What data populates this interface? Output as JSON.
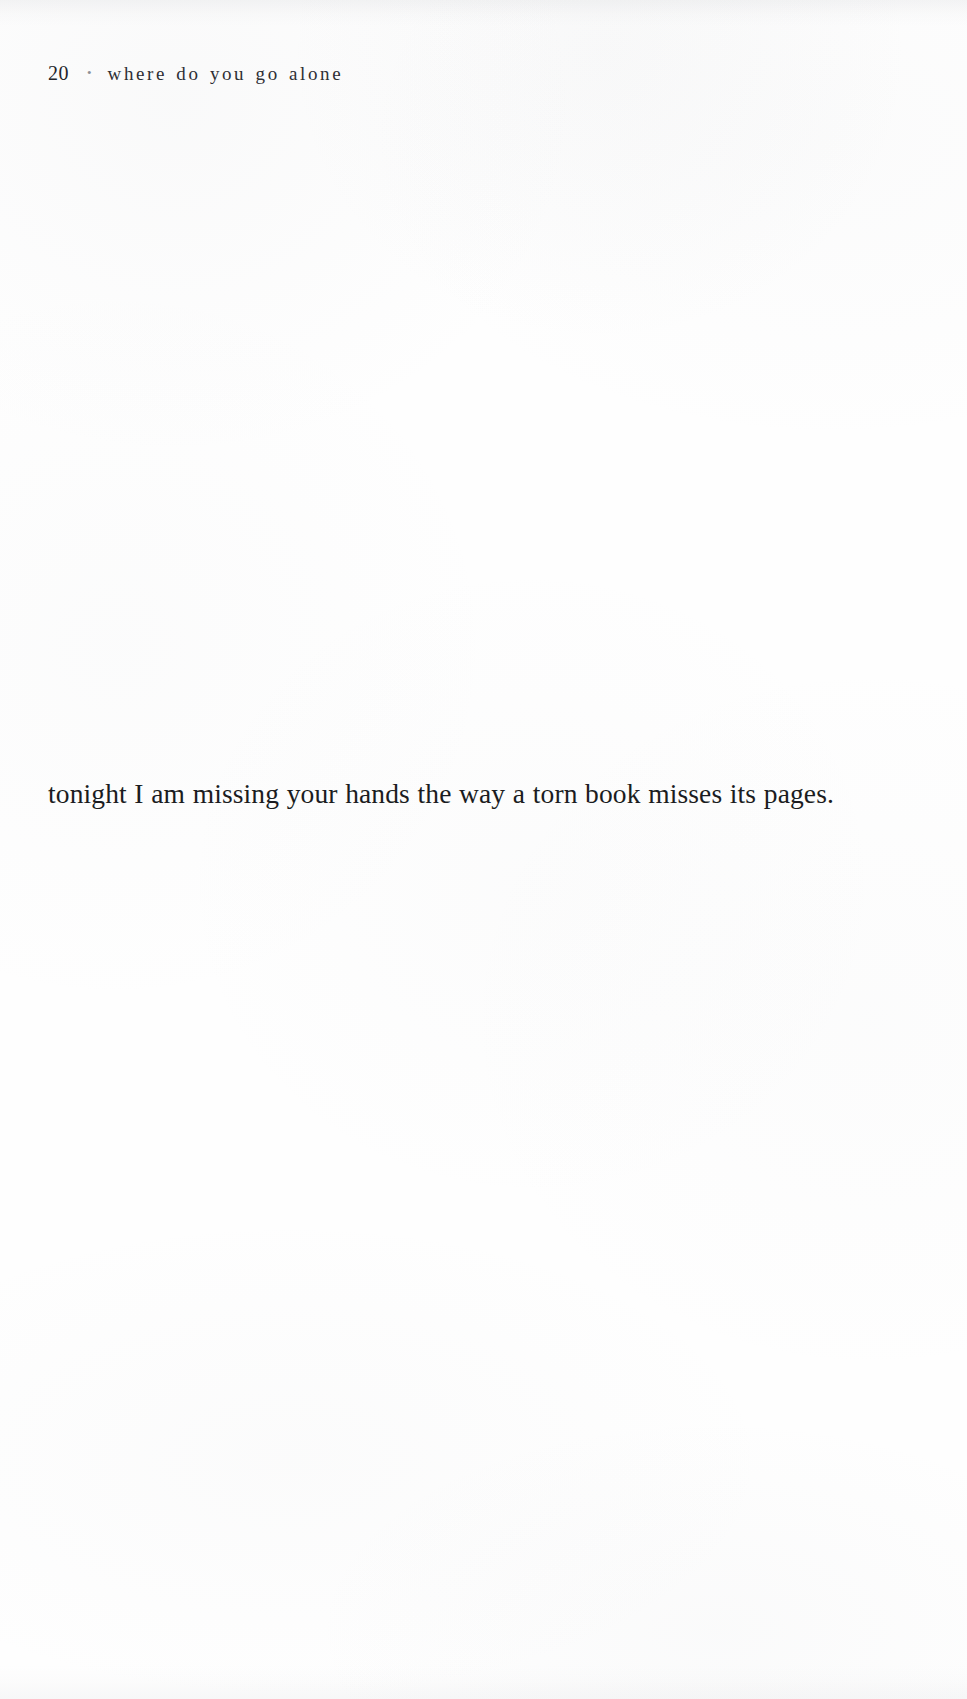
{
  "page": {
    "folio": "20",
    "separator_glyph": "•",
    "running_title": "where do you go alone",
    "paper_color": "#fefefe",
    "ink_color": "#1b1c21",
    "running_head_color": "#2e2f35"
  },
  "body": {
    "lines": [
      "tonight I am missing your hands the way a torn book misses its pages."
    ]
  }
}
